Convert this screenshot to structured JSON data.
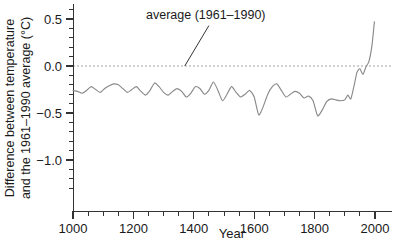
{
  "chart_data": {
    "type": "line",
    "title": "",
    "xlabel": "Year",
    "ylabel_line1": "Difference between temperature",
    "ylabel_line2": "and the 1961–1990 average (°C)",
    "ylabel_full": "Difference between temperature and the 1961–1990 average (°C)",
    "xlim": [
      1000,
      2000
    ],
    "ylim": [
      -1.35,
      0.62
    ],
    "grid": false,
    "legend": "none",
    "x_major_ticks": [
      1000,
      1200,
      1400,
      1600,
      1800,
      2000
    ],
    "x_major_tick_labels": [
      "1000",
      "1200",
      "1400",
      "1600",
      "1800",
      "2000"
    ],
    "x_minor_tick_step": 50,
    "y_major_ticks": [
      0.5,
      0.0,
      -0.5,
      -1.0
    ],
    "y_major_tick_labels": [
      "0.5",
      "0.0",
      "−0.5",
      "−1.0"
    ],
    "y_minor_tick_step": 0.1,
    "reference_line": {
      "value": 0.0,
      "style": "dashed",
      "color": "#9a9a9a",
      "label": "average (1961–1990)"
    },
    "annotations": [
      {
        "text": "average (1961–1990)",
        "text_x": 1390,
        "text_y": 0.52,
        "pointer_from_x": 1450,
        "pointer_from_y": 0.43,
        "pointer_to_x": 1370,
        "pointer_to_y": 0.0
      }
    ],
    "series": [
      {
        "name": "Northern Hemisphere temperature anomaly",
        "color": "#8a8a8a",
        "x": [
          1000,
          1015,
          1030,
          1045,
          1060,
          1075,
          1090,
          1105,
          1120,
          1135,
          1150,
          1165,
          1180,
          1195,
          1210,
          1225,
          1240,
          1255,
          1270,
          1285,
          1300,
          1315,
          1330,
          1345,
          1360,
          1375,
          1390,
          1405,
          1420,
          1435,
          1450,
          1465,
          1480,
          1495,
          1510,
          1525,
          1540,
          1555,
          1570,
          1585,
          1600,
          1615,
          1630,
          1645,
          1660,
          1675,
          1690,
          1705,
          1720,
          1735,
          1750,
          1765,
          1780,
          1795,
          1810,
          1825,
          1840,
          1855,
          1870,
          1885,
          1900,
          1910,
          1920,
          1930,
          1940,
          1950,
          1960,
          1970,
          1980,
          1990,
          1998
        ],
        "values": [
          -0.26,
          -0.27,
          -0.29,
          -0.26,
          -0.22,
          -0.25,
          -0.28,
          -0.24,
          -0.21,
          -0.19,
          -0.2,
          -0.24,
          -0.28,
          -0.25,
          -0.22,
          -0.27,
          -0.31,
          -0.26,
          -0.18,
          -0.22,
          -0.28,
          -0.31,
          -0.27,
          -0.24,
          -0.27,
          -0.33,
          -0.29,
          -0.22,
          -0.24,
          -0.3,
          -0.26,
          -0.17,
          -0.26,
          -0.37,
          -0.3,
          -0.22,
          -0.28,
          -0.33,
          -0.3,
          -0.26,
          -0.33,
          -0.52,
          -0.43,
          -0.3,
          -0.22,
          -0.19,
          -0.26,
          -0.33,
          -0.3,
          -0.27,
          -0.29,
          -0.34,
          -0.32,
          -0.37,
          -0.53,
          -0.47,
          -0.38,
          -0.35,
          -0.36,
          -0.37,
          -0.36,
          -0.31,
          -0.35,
          -0.22,
          -0.07,
          -0.03,
          -0.09,
          -0.01,
          0.05,
          0.22,
          0.47
        ]
      }
    ]
  }
}
